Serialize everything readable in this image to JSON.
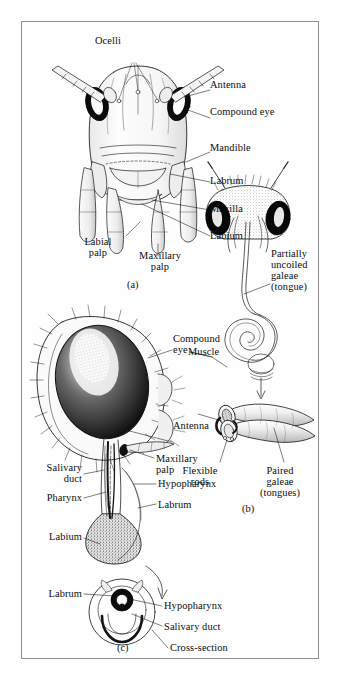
{
  "figure": {
    "border_color": "#8e8e92",
    "background_color": "#fefefe",
    "ink_color": "#0d0d0d",
    "panels": [
      {
        "id": "a",
        "caption": "(a)",
        "subject": "grasshopper-head-frontal",
        "labels": [
          "Ocelli",
          "Antenna",
          "Compound eye",
          "Mandible",
          "Labrum",
          "Maxilla",
          "Labium",
          "Labial\npalp",
          "Maxillary\npalp"
        ]
      },
      {
        "id": "b",
        "caption": "(b)",
        "subject": "butterfly-head-and-coiled-proboscis",
        "labels": [
          "Partially\nuncoiled\ngaleae\n(tongue)",
          "Muscle",
          "Flexible\nrods",
          "Paired\ngaleae\n(tongues)"
        ]
      },
      {
        "id": "c",
        "caption": "(c)",
        "subject": "mosquito-head-lateral-and-proboscis-cross-section",
        "labels": [
          "Compound\neye",
          "Antenna",
          "Salivary\nduct",
          "Pharynx",
          "Labium",
          "Maxillary\npalp",
          "Hypopharynx",
          "Labrum",
          "Labrum",
          "Hypopharynx",
          "Salivary duct",
          "Cross-section"
        ]
      }
    ]
  },
  "panel_a": {
    "caption": "(a)",
    "ocelli": "Ocelli",
    "antenna": "Antenna",
    "compound_eye": "Compound eye",
    "mandible": "Mandible",
    "labrum": "Labrum",
    "maxilla": "Maxilla",
    "labium": "Labium",
    "labial_palp_line1": "Labial",
    "labial_palp_line2": "palp",
    "maxillary_palp_line1": "Maxillary",
    "maxillary_palp_line2": "palp"
  },
  "panel_b": {
    "caption": "(b)",
    "partially_line1": "Partially",
    "partially_line2": "uncoiled",
    "partially_line3": "galeae",
    "partially_line4": "(tongue)",
    "muscle": "Muscle",
    "flexible_line1": "Flexible",
    "flexible_line2": "rods",
    "paired_line1": "Paired",
    "paired_line2": "galeae",
    "paired_line3": "(tongues)"
  },
  "panel_c": {
    "caption": "(c)",
    "compound_line1": "Compound",
    "compound_line2": "eye",
    "antenna": "Antenna",
    "salivary_line1": "Salivary",
    "salivary_line2": "duct",
    "pharynx": "Pharynx",
    "labium": "Labium",
    "maxillary_line1": "Maxillary",
    "maxillary_line2": "palp",
    "hypopharynx": "Hypopharynx",
    "labrum": "Labrum",
    "xs_labrum": "Labrum",
    "xs_hypopharynx": "Hypopharynx",
    "xs_salivary_duct": "Salivary duct",
    "xs_cross_section": "Cross-section"
  }
}
